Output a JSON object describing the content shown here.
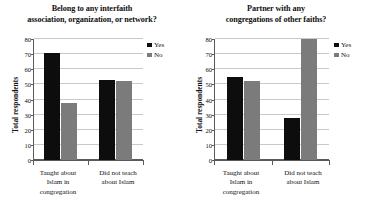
{
  "figure": {
    "background": "#ffffff",
    "series_colors": {
      "yes": "#0d0d0d",
      "no": "#7b7b7b"
    }
  },
  "chart_data": [
    {
      "type": "bar",
      "title_line1": "Belong to any interfaith",
      "title_line2": "association, organization, or network?",
      "title": "Belong to any interfaith association, organization, or network?",
      "categories": [
        "Taught about Islam in congregation",
        "Did not teach about Islam"
      ],
      "category_lines": [
        [
          "Taught about",
          "Islam in",
          "congregation"
        ],
        [
          "Did not teach",
          "about Islam"
        ]
      ],
      "series": [
        {
          "name": "Yes",
          "values": [
            71,
            53
          ],
          "color": "#0d0d0d"
        },
        {
          "name": "No",
          "values": [
            38,
            52
          ],
          "color": "#7b7b7b"
        }
      ],
      "xlabel": "",
      "ylabel": "Total respondents",
      "ylim": [
        0,
        80
      ],
      "yticks": [
        0,
        10,
        20,
        30,
        40,
        50,
        60,
        70,
        80
      ],
      "ytick_labels": [
        "0",
        "10",
        "20",
        "30",
        "40",
        "50",
        "60",
        "70",
        "80"
      ],
      "grid": true,
      "legend_position": "right",
      "legend": [
        "Yes",
        "No"
      ]
    },
    {
      "type": "bar",
      "title_line1": "Partner with any",
      "title_line2": "congregations of other faiths?",
      "title": "Partner with any congregations of other faiths?",
      "categories": [
        "Taught about Islam in congregation",
        "Did not teach about Islam"
      ],
      "category_lines": [
        [
          "Taught about",
          "Islam in",
          "congregation"
        ],
        [
          "Did not teach",
          "about Islam"
        ]
      ],
      "series": [
        {
          "name": "Yes",
          "values": [
            55,
            28
          ],
          "color": "#0d0d0d"
        },
        {
          "name": "No",
          "values": [
            52,
            80
          ],
          "color": "#7b7b7b"
        }
      ],
      "xlabel": "",
      "ylabel": "Total respondents",
      "ylim": [
        0,
        80
      ],
      "yticks": [
        0,
        10,
        20,
        30,
        40,
        50,
        60,
        70,
        80
      ],
      "ytick_labels": [
        "0",
        "10",
        "20",
        "30",
        "40",
        "50",
        "60",
        "70",
        "80"
      ],
      "grid": true,
      "legend_position": "right",
      "legend": [
        "Yes",
        "No"
      ]
    }
  ]
}
